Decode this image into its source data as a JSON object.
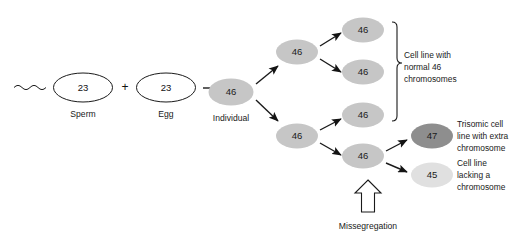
{
  "figure": {
    "type": "biology-flow-diagram",
    "background_color": "#ffffff"
  },
  "gametes": {
    "plus_symbol": "+",
    "sperm": {
      "value": "23",
      "label": "Sperm",
      "fill": "#ffffff",
      "stroke": "#1a1a1a"
    },
    "egg": {
      "value": "23",
      "label": "Egg",
      "fill": "#ffffff",
      "stroke": "#1a1a1a"
    }
  },
  "individual": {
    "value": "46",
    "label": "Individual",
    "fill": "#c6c6c6"
  },
  "lineage": {
    "upper_branch": {
      "parent": {
        "value": "46",
        "fill": "#c6c6c6"
      },
      "children": [
        {
          "value": "46",
          "fill": "#c6c6c6"
        },
        {
          "value": "46",
          "fill": "#c6c6c6"
        }
      ]
    },
    "lower_branch": {
      "parent": {
        "value": "46",
        "fill": "#c6c6c6"
      },
      "children": [
        {
          "value": "46",
          "fill": "#c6c6c6"
        },
        {
          "value": "46",
          "fill": "#c6c6c6"
        }
      ]
    },
    "missegregation_products": [
      {
        "value": "47",
        "fill": "#8e8e8e"
      },
      {
        "value": "45",
        "fill": "#e0e0e0"
      }
    ]
  },
  "annotations": {
    "normal_line": {
      "line1": "Cell line with",
      "line2": "normal 46",
      "line3": "chromosomes"
    },
    "trisomic_line": {
      "line1": "Trisomic cell",
      "line2": "line with extra",
      "line3": "chromosome"
    },
    "monosomic_line": {
      "line1": "Cell line",
      "line2": "lacking a",
      "line3": "chromosome"
    },
    "missegregation_label": "Missegregation"
  },
  "colors": {
    "normal_cell": "#c6c6c6",
    "trisomic_cell": "#8e8e8e",
    "monosomic_cell": "#e0e0e0",
    "ink": "#1a1a1a"
  }
}
